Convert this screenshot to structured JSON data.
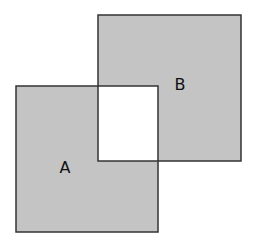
{
  "diagram": {
    "type": "set-intersection-squares",
    "colors": {
      "fill": "#c4c4c4",
      "stroke": "#333333",
      "intersection": "#ffffff",
      "label": "#111111"
    },
    "shapes": [
      {
        "id": "A",
        "label": "A",
        "x": 16,
        "y": 86,
        "width": 142,
        "height": 146,
        "label_x": 65,
        "label_y": 173
      },
      {
        "id": "B",
        "label": "B",
        "x": 98,
        "y": 15,
        "width": 143,
        "height": 146,
        "label_x": 180,
        "label_y": 90
      }
    ],
    "intersection": {
      "x": 98,
      "y": 86,
      "width": 60,
      "height": 75
    }
  }
}
